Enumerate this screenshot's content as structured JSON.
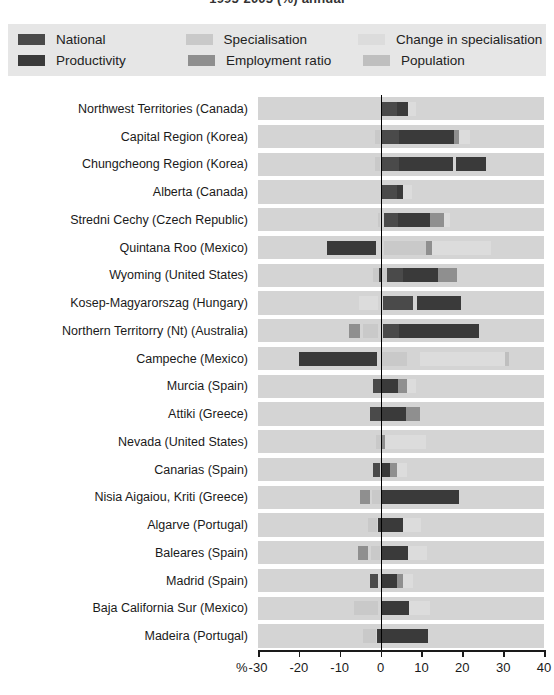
{
  "title": "1995-2005 (%) annual",
  "legend": {
    "position": "top",
    "rows": [
      [
        {
          "key": "national",
          "label": "National",
          "color": "#4a4a4a"
        },
        {
          "key": "specialisation",
          "label": "Specialisation",
          "color": "#c9c9c9"
        },
        {
          "key": "change_in_specialisation",
          "label": "Change in specialisation",
          "color": "#dcdcdc"
        }
      ],
      [
        {
          "key": "productivity",
          "label": "Productivity",
          "color": "#3a3a3a"
        },
        {
          "key": "employment_ratio",
          "label": "Employment ratio",
          "color": "#8f8f8f"
        },
        {
          "key": "population",
          "label": "Population",
          "color": "#bfbfbf"
        }
      ]
    ]
  },
  "chart_data": {
    "type": "bar",
    "orientation": "horizontal",
    "stacked": true,
    "title": "1995-2005 (%) annual",
    "xlabel": "%",
    "ylabel": "",
    "xlim": [
      -30,
      40
    ],
    "xticks": [
      -30,
      -20,
      -10,
      0,
      10,
      20,
      30,
      40
    ],
    "xticklabels": [
      "-30",
      "-20",
      "-10",
      "0",
      "10",
      "20",
      "30",
      "40"
    ],
    "grid": false,
    "zero_line": true,
    "series_order": [
      "national",
      "productivity",
      "specialisation",
      "employment_ratio",
      "change_in_specialisation",
      "population"
    ],
    "series_colors": {
      "national": "#4a4a4a",
      "productivity": "#3a3a3a",
      "specialisation": "#c9c9c9",
      "employment_ratio": "#8f8f8f",
      "change_in_specialisation": "#dcdcdc",
      "population": "#bfbfbf"
    },
    "categories": [
      "Northwest Territories (Canada)",
      "Capital Region (Korea)",
      "Chungcheong Region (Korea)",
      "Alberta (Canada)",
      "Stredni Cechy (Czech Republic)",
      "Quintana Roo (Mexico)",
      "Wyoming (United States)",
      "Kosep-Magyarorszag (Hungary)",
      "Northern Territorry (Nt) (Australia)",
      "Campeche (Mexico)",
      "Murcia (Spain)",
      "Attiki (Greece)",
      "Nevada (United States)",
      "Canarias  (Spain)",
      "Nisia Aigaiou, Kriti (Greece)",
      "Algarve (Portugal)",
      "Baleares (Spain)",
      "Madrid (Spain)",
      "Baja California Sur (Mexico)",
      "Madeira (Portugal)"
    ],
    "series": [
      {
        "name": "National",
        "key": "national",
        "color": "#4a4a4a",
        "values": [
          4.0,
          4.6,
          4.6,
          4.0,
          4.2,
          3.2,
          4.0,
          4.4,
          4.1,
          3.2,
          3.6,
          3.6,
          4.0,
          3.6,
          3.6,
          3.6,
          3.6,
          3.6,
          3.2,
          3.6
        ]
      },
      {
        "name": "Productivity",
        "key": "productivity",
        "color": "#3a3a3a",
        "values": [
          2.6,
          13.4,
          17.8,
          2.6,
          9.8,
          7.8,
          9.9,
          8.1,
          13.0,
          16.4,
          3.2,
          4.3,
          6.6,
          2.0,
          9.6,
          5.6,
          6.7,
          4.1,
          9.4,
          9.6
        ]
      },
      {
        "name": "Specialisation",
        "key": "specialisation",
        "color": "#c9c9c9",
        "values": [
          -0.2,
          -1.0,
          -1.0,
          -0.2,
          -0.6,
          4.6,
          -0.8,
          1.6,
          4.0,
          5.0,
          -1.1,
          -1.9,
          -4.2,
          -3.2,
          -2.0,
          -3.0,
          -4.4,
          -1.8,
          -3.2,
          -2.0
        ]
      },
      {
        "name": "Employment ratio",
        "key": "employment_ratio",
        "color": "#8f8f8f",
        "values": [
          1.9,
          0.9,
          0.0,
          0.0,
          2.0,
          0.7,
          1.6,
          0.0,
          1.3,
          0.0,
          1.7,
          1.9,
          1.2,
          2.6,
          1.5,
          2.7,
          2.3,
          1.9,
          2.6,
          0.0
        ]
      },
      {
        "name": "Change in specialisation",
        "key": "change_in_specialisation",
        "color": "#dcdcdc",
        "values": [
          1.0,
          1.5,
          0.0,
          1.3,
          1.1,
          9.0,
          0.0,
          0.0,
          0.0,
          0.5,
          1.0,
          4.6,
          3.2,
          2.7,
          0.0,
          2.2,
          3.2,
          1.4,
          3.0,
          0.0
        ]
      },
      {
        "name": "Population",
        "key": "population",
        "color": "#bfbfbf",
        "values": [
          0.0,
          0.0,
          0.0,
          0.0,
          0.0,
          0.0,
          0.0,
          0.0,
          0.0,
          0.0,
          0.0,
          0.0,
          0.0,
          0.0,
          0.0,
          0.0,
          0.0,
          0.0,
          0.0,
          0.0
        ]
      }
    ],
    "bars": [
      {
        "category": "Northwest Territories (Canada)",
        "segments": [
          {
            "key": "national",
            "start": 0.0,
            "end": 4.0
          },
          {
            "key": "productivity",
            "start": 4.0,
            "end": 6.6
          },
          {
            "key": "change_in_specialisation",
            "start": 6.6,
            "end": 8.6
          }
        ]
      },
      {
        "category": "Capital Region (Korea)",
        "segments": [
          {
            "key": "specialisation",
            "start": -1.3,
            "end": -0.2
          },
          {
            "key": "national",
            "start": 0.4,
            "end": 4.6
          },
          {
            "key": "productivity",
            "start": 4.6,
            "end": 18.0
          },
          {
            "key": "employment_ratio",
            "start": 18.0,
            "end": 19.2
          },
          {
            "key": "change_in_specialisation",
            "start": 19.2,
            "end": 21.8
          }
        ]
      },
      {
        "category": "Chungcheong Region (Korea)",
        "segments": [
          {
            "key": "specialisation",
            "start": -1.3,
            "end": -0.2
          },
          {
            "key": "national",
            "start": 0.4,
            "end": 4.6
          },
          {
            "key": "productivity",
            "start": 4.6,
            "end": 17.8
          },
          {
            "key": "productivity",
            "start": 18.4,
            "end": 25.8
          }
        ]
      },
      {
        "category": "Alberta (Canada)",
        "segments": [
          {
            "key": "national",
            "start": 0.0,
            "end": 4.0
          },
          {
            "key": "productivity",
            "start": 4.0,
            "end": 5.4
          },
          {
            "key": "change_in_specialisation",
            "start": 5.4,
            "end": 7.8
          }
        ]
      },
      {
        "category": "Stredni Cechy (Czech Republic)",
        "segments": [
          {
            "key": "specialisation",
            "start": -0.6,
            "end": -0.1
          },
          {
            "key": "national",
            "start": 0.8,
            "end": 4.2
          },
          {
            "key": "productivity",
            "start": 4.2,
            "end": 12.0
          },
          {
            "key": "employment_ratio",
            "start": 12.0,
            "end": 15.5
          },
          {
            "key": "change_in_specialisation",
            "start": 15.5,
            "end": 17.0
          }
        ]
      },
      {
        "category": "Quintana Roo (Mexico)",
        "segments": [
          {
            "key": "productivity",
            "start": -13.0,
            "end": -1.0
          },
          {
            "key": "specialisation",
            "start": 0.8,
            "end": 11.0
          },
          {
            "key": "employment_ratio",
            "start": 11.0,
            "end": 12.5
          },
          {
            "key": "change_in_specialisation",
            "start": 12.5,
            "end": 27.0
          }
        ]
      },
      {
        "category": "Wyoming (United States)",
        "segments": [
          {
            "key": "specialisation",
            "start": -1.8,
            "end": -0.4
          },
          {
            "key": "national",
            "start": -0.5,
            "end": 0.0
          },
          {
            "key": "specialisation",
            "start": 0.2,
            "end": 1.6
          },
          {
            "key": "national",
            "start": 1.6,
            "end": 5.6
          },
          {
            "key": "productivity",
            "start": 5.6,
            "end": 14.0
          },
          {
            "key": "employment_ratio",
            "start": 14.0,
            "end": 18.6
          }
        ]
      },
      {
        "category": "Kosep-Magyarorszag (Hungary)",
        "segments": [
          {
            "key": "change_in_specialisation",
            "start": -5.2,
            "end": -0.6
          },
          {
            "key": "national",
            "start": 0.5,
            "end": 8.0
          },
          {
            "key": "productivity",
            "start": 9.0,
            "end": 19.6
          }
        ]
      },
      {
        "category": "Northern Territorry (Nt) (Australia)",
        "segments": [
          {
            "key": "employment_ratio",
            "start": -7.8,
            "end": -5.0
          },
          {
            "key": "specialisation",
            "start": -4.4,
            "end": -0.6
          },
          {
            "key": "national",
            "start": 0.5,
            "end": 4.5
          },
          {
            "key": "productivity",
            "start": 4.5,
            "end": 24.0
          }
        ]
      },
      {
        "category": "Campeche (Mexico)",
        "segments": [
          {
            "key": "productivity",
            "start": -20.0,
            "end": -0.8
          },
          {
            "key": "specialisation",
            "start": 0.4,
            "end": 6.4
          },
          {
            "key": "change_in_specialisation",
            "start": 9.6,
            "end": 30.4
          },
          {
            "key": "population",
            "start": 30.4,
            "end": 31.4
          }
        ]
      },
      {
        "category": "Murcia (Spain)",
        "segments": [
          {
            "key": "national",
            "start": -1.8,
            "end": 0.0
          },
          {
            "key": "productivity",
            "start": 0.0,
            "end": 4.2
          },
          {
            "key": "employment_ratio",
            "start": 4.2,
            "end": 6.4
          },
          {
            "key": "change_in_specialisation",
            "start": 6.4,
            "end": 8.6
          }
        ]
      },
      {
        "category": "Attiki (Greece)",
        "segments": [
          {
            "key": "national",
            "start": -2.6,
            "end": 0.0
          },
          {
            "key": "productivity",
            "start": 0.0,
            "end": 6.2
          },
          {
            "key": "employment_ratio",
            "start": 6.2,
            "end": 9.6
          }
        ]
      },
      {
        "category": "Nevada (United States)",
        "segments": [
          {
            "key": "specialisation",
            "start": -1.2,
            "end": 0.2
          },
          {
            "key": "employment_ratio",
            "start": 0.2,
            "end": 1.2
          },
          {
            "key": "change_in_specialisation",
            "start": 1.2,
            "end": 11.0
          }
        ]
      },
      {
        "category": "Canarias  (Spain)",
        "segments": [
          {
            "key": "national",
            "start": -1.8,
            "end": -0.2
          },
          {
            "key": "productivity",
            "start": 0.4,
            "end": 2.4
          },
          {
            "key": "employment_ratio",
            "start": 2.4,
            "end": 4.0
          },
          {
            "key": "change_in_specialisation",
            "start": 4.0,
            "end": 6.4
          }
        ]
      },
      {
        "category": "Nisia Aigaiou, Kriti (Greece)",
        "segments": [
          {
            "key": "employment_ratio",
            "start": -5.0,
            "end": -2.6
          },
          {
            "key": "specialisation",
            "start": -2.0,
            "end": 0.2
          },
          {
            "key": "productivity",
            "start": 0.2,
            "end": 9.6
          },
          {
            "key": "productivity",
            "start": 9.6,
            "end": 19.2
          }
        ]
      },
      {
        "category": "Algarve (Portugal)",
        "segments": [
          {
            "key": "specialisation",
            "start": -3.0,
            "end": -0.8
          },
          {
            "key": "productivity",
            "start": -0.6,
            "end": 5.6
          },
          {
            "key": "change_in_specialisation",
            "start": 5.6,
            "end": 10.0
          }
        ]
      },
      {
        "category": "Baleares (Spain)",
        "segments": [
          {
            "key": "employment_ratio",
            "start": -5.6,
            "end": -3.0
          },
          {
            "key": "specialisation",
            "start": -2.4,
            "end": -0.2
          },
          {
            "key": "productivity",
            "start": 0.2,
            "end": 6.7
          },
          {
            "key": "change_in_specialisation",
            "start": 6.7,
            "end": 11.4
          }
        ]
      },
      {
        "category": "Madrid (Spain)",
        "segments": [
          {
            "key": "national",
            "start": -2.6,
            "end": -0.6
          },
          {
            "key": "productivity",
            "start": 0.2,
            "end": 4.1
          },
          {
            "key": "employment_ratio",
            "start": 4.1,
            "end": 5.6
          },
          {
            "key": "change_in_specialisation",
            "start": 5.6,
            "end": 8.0
          }
        ]
      },
      {
        "category": "Baja California Sur (Mexico)",
        "segments": [
          {
            "key": "specialisation",
            "start": -6.6,
            "end": -0.6
          },
          {
            "key": "productivity",
            "start": 0.2,
            "end": 7.0
          },
          {
            "key": "change_in_specialisation",
            "start": 7.0,
            "end": 12.2
          }
        ]
      },
      {
        "category": "Madeira (Portugal)",
        "segments": [
          {
            "key": "specialisation",
            "start": -4.4,
            "end": -1.0
          },
          {
            "key": "productivity",
            "start": -0.8,
            "end": 3.6
          },
          {
            "key": "productivity",
            "start": 3.6,
            "end": 11.6
          }
        ]
      }
    ]
  }
}
